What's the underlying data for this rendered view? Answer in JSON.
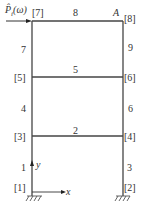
{
  "diagram": {
    "load_label": "P̂",
    "load_sub": "i",
    "load_arg": "(ω)",
    "point_A": "A",
    "nodes": [
      "[1]",
      "[2]",
      "[3]",
      "[4]",
      "[5]",
      "[6]",
      "[7]",
      "[8]"
    ],
    "members": [
      "1",
      "2",
      "3",
      "4",
      "5",
      "6",
      "7",
      "8",
      "9"
    ],
    "axis_x": "x",
    "axis_y": "y"
  }
}
